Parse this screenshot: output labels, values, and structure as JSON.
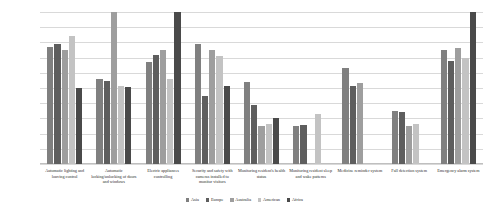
{
  "chart_data": {
    "type": "bar",
    "title": "",
    "xlabel": "",
    "ylabel": "",
    "ylim": [
      0,
      1.0
    ],
    "grid": true,
    "legend_position": "bottom",
    "ytick_labels": [
      "100.0%",
      "90.0%",
      "80.0%",
      "70.0%",
      "60.0%",
      "50.0%",
      "40.0%",
      "30.0%",
      "20.0%",
      "10.0%",
      "0.0%"
    ],
    "ytick_values": [
      1.0,
      0.9,
      0.8,
      0.7,
      0.6,
      0.5,
      0.4,
      0.3,
      0.2,
      0.1,
      0.0
    ],
    "categories": [
      "Automatic lighting and louving control",
      "Automatic locking/unlocking of doors and windows",
      "Electric appliances controlling",
      "Security and safety with cameras installed to monitor visitors",
      "Monitoring resident's health status",
      "Monitoring resident sleep and wake patterns",
      "Medicine reminder system",
      "Fall detection system",
      "Emergency alarm system"
    ],
    "series": [
      {
        "name": "Asia",
        "color": "#808080",
        "values": [
          0.77,
          0.56,
          0.67,
          0.79,
          0.54,
          0.25,
          0.63,
          0.35,
          0.75
        ]
      },
      {
        "name": "Europe",
        "color": "#5e5e5e",
        "values": [
          0.79,
          0.545,
          0.72,
          0.45,
          0.39,
          0.255,
          0.51,
          0.34,
          0.68
        ]
      },
      {
        "name": "Australia",
        "color": "#9e9e9e",
        "values": [
          0.75,
          1.0,
          0.75,
          0.75,
          0.25,
          0.0,
          0.53,
          0.25,
          0.76
        ]
      },
      {
        "name": "American",
        "color": "#c3c3c3",
        "values": [
          0.84,
          0.51,
          0.56,
          0.71,
          0.26,
          0.33,
          0.0,
          0.26,
          0.7
        ]
      },
      {
        "name": "Africa",
        "color": "#4a4a4a",
        "values": [
          0.5,
          0.505,
          1.0,
          0.51,
          0.3,
          0.0,
          0.0,
          0.0,
          1.0
        ]
      }
    ]
  }
}
